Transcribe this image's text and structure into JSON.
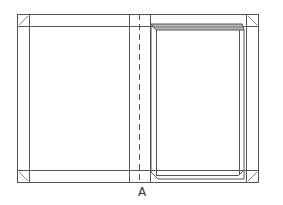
{
  "diagram": {
    "figure_label": "A",
    "colors": {
      "line": "#555555",
      "background": "#ffffff",
      "book_shade": "#b9b9b9"
    },
    "parts": [
      "outer-frame",
      "turn-in-band-top",
      "turn-in-band-bottom",
      "turn-in-band-left",
      "turn-in-band-right",
      "corner-miter-marks",
      "spine-fold-lines",
      "spine-center-dashed-line",
      "book-block"
    ]
  }
}
